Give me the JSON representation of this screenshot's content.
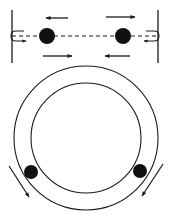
{
  "diagram": {
    "colors": {
      "stroke": "#1a1a1a",
      "ball": "#111111",
      "background": "#ffffff"
    },
    "top_panel": {
      "description": "Two balls moving between two walls along a dashed line",
      "walls": [
        {
          "x": 12,
          "y1": 10,
          "y2": 63
        },
        {
          "x": 158,
          "y1": 10,
          "y2": 63
        }
      ],
      "track": {
        "y": 36,
        "x1": 12,
        "x2": 158,
        "style": "dashed"
      },
      "balls": [
        {
          "cx": 47,
          "cy": 36,
          "r": 8
        },
        {
          "cx": 123,
          "cy": 36,
          "r": 8
        }
      ],
      "arrows": [
        {
          "x1": 68,
          "y1": 18,
          "x2": 46,
          "y2": 18,
          "direction": "left"
        },
        {
          "x1": 106,
          "y1": 17,
          "x2": 135,
          "y2": 17,
          "direction": "right"
        },
        {
          "x1": 43,
          "y1": 56,
          "x2": 72,
          "y2": 56,
          "direction": "right"
        },
        {
          "x1": 130,
          "y1": 56,
          "x2": 105,
          "y2": 56,
          "direction": "left"
        }
      ],
      "wall_bounce_arrows": [
        {
          "side": "left",
          "x": 12,
          "y": 36
        },
        {
          "side": "right",
          "x": 158,
          "y": 36
        }
      ]
    },
    "bottom_panel": {
      "description": "Two balls inside an annular ring track",
      "ring": {
        "cx": 86,
        "cy": 138,
        "outer_r": 72,
        "inner_r": 55
      },
      "balls": [
        {
          "cx": 31,
          "cy": 172,
          "r": 7
        },
        {
          "cx": 140,
          "cy": 171,
          "r": 7
        }
      ],
      "arrows": [
        {
          "x1": 9,
          "y1": 166,
          "x2": 29,
          "y2": 197,
          "direction": "down-right"
        },
        {
          "x1": 163,
          "y1": 164,
          "x2": 142,
          "y2": 196,
          "direction": "down-left"
        }
      ]
    }
  }
}
